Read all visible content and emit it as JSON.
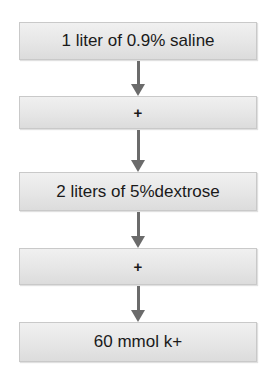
{
  "diagram": {
    "type": "flowchart",
    "direction": "top-to-bottom",
    "colors": {
      "box_fill": "#e6e6e6",
      "box_border": "#c9c9c9",
      "arrow": "#6b6b6b",
      "text": "#1a1a1a"
    },
    "nodes": [
      {
        "label": "1 liter of 0.9% saline"
      },
      {
        "label": "+"
      },
      {
        "label": "2 liters of 5%dextrose"
      },
      {
        "label": "+"
      },
      {
        "label": "60 mmol k+"
      }
    ],
    "edges": [
      {
        "from": 0,
        "to": 1,
        "icon": "arrow-down-icon"
      },
      {
        "from": 1,
        "to": 2,
        "icon": "arrow-down-icon"
      },
      {
        "from": 2,
        "to": 3,
        "icon": "arrow-down-icon"
      },
      {
        "from": 3,
        "to": 4,
        "icon": "arrow-down-icon"
      }
    ]
  }
}
